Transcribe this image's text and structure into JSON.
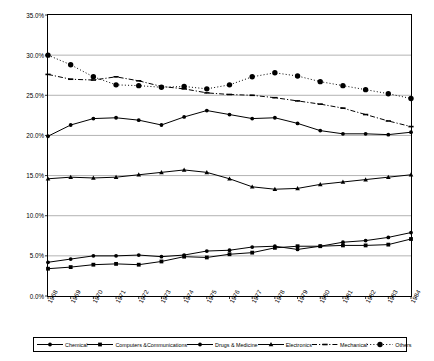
{
  "chart_data": {
    "type": "line",
    "title": "",
    "xlabel": "",
    "ylabel": "",
    "ylim": [
      0,
      35
    ],
    "ytick_format": "percent",
    "grid": true,
    "legend_position": "bottom",
    "categories": [
      "1968",
      "1969",
      "1970",
      "1971",
      "1972",
      "1973",
      "1974",
      "1975",
      "1976",
      "1977",
      "1978",
      "1979",
      "1980",
      "1981",
      "1982",
      "1983",
      "1984"
    ],
    "yticks": [
      "0.0%",
      "5.0%",
      "10.0%",
      "15.0%",
      "20.0%",
      "25.0%",
      "30.0%",
      "35.0%"
    ],
    "ytick_values": [
      0,
      5,
      10,
      15,
      20,
      25,
      30,
      35
    ],
    "series": [
      {
        "name": "Chemical",
        "marker": "circle",
        "line": "solid",
        "values": [
          19.9,
          21.3,
          22.1,
          22.2,
          22.0,
          21.6,
          22.4,
          23.1,
          22.3,
          21.6,
          21.8,
          22.3,
          23.1,
          22.5,
          22.6,
          21.5,
          20.4
        ]
      },
      {
        "name": "Computers &Communications",
        "marker": "square",
        "line": "solid",
        "values": [
          3.4,
          3.7,
          3.9,
          4.0,
          3.9,
          4.3,
          4.8,
          4.8,
          5.3,
          5.6,
          6.1,
          6.1,
          6.2,
          6.3,
          6.3,
          6.4,
          7.0
        ]
      },
      {
        "name": "Drugs & Medicine",
        "marker": "circle",
        "line": "solid",
        "values": [
          4.2,
          4.5,
          5.0,
          5.0,
          5.1,
          4.9,
          5.0,
          5.6,
          5.7,
          6.1,
          6.2,
          5.8,
          6.2,
          6.6,
          6.9,
          7.3,
          7.9
        ]
      },
      {
        "name": "Electronics",
        "marker": "triangle",
        "line": "solid",
        "values": [
          14.6,
          14.8,
          14.7,
          14.8,
          15.1,
          15.4,
          15.7,
          15.4,
          14.6,
          13.6,
          13.3,
          13.4,
          13.9,
          14.2,
          14.5,
          14.8,
          15.1
        ]
      },
      {
        "name": "Mechanical",
        "marker": "dash",
        "line": "dashdot",
        "values": [
          27.6,
          27.0,
          26.9,
          27.3,
          26.8,
          26.1,
          25.8,
          25.3,
          25.1,
          25.0,
          24.7,
          24.3,
          23.9,
          23.4,
          22.6,
          21.8,
          21.1
        ]
      },
      {
        "name": "Others",
        "marker": "bigdot",
        "line": "dotted",
        "values": [
          30.0,
          28.8,
          27.3,
          26.3,
          26.2,
          26.0,
          26.1,
          25.8,
          26.3,
          27.3,
          27.8,
          27.4,
          26.7,
          26.2,
          25.7,
          25.2,
          24.6
        ]
      }
    ],
    "series_plotted": [
      {
        "name": "Chemical",
        "values": [
          19.9,
          21.3,
          22.1,
          22.2,
          21.9,
          21.3,
          22.3,
          23.1,
          22.6,
          22.1,
          22.2,
          21.5,
          20.6,
          20.2,
          20.2,
          20.1,
          20.4
        ]
      },
      {
        "name": "Computers &Communications",
        "values": [
          3.4,
          3.6,
          3.9,
          4.0,
          3.9,
          4.3,
          4.9,
          4.8,
          5.2,
          5.4,
          6.0,
          6.2,
          6.2,
          6.3,
          6.3,
          6.4,
          7.1
        ]
      },
      {
        "name": "Drugs & Medicine",
        "values": [
          4.2,
          4.6,
          5.0,
          5.0,
          5.1,
          4.9,
          5.1,
          5.6,
          5.7,
          6.1,
          6.2,
          5.8,
          6.2,
          6.7,
          6.9,
          7.3,
          7.9
        ]
      },
      {
        "name": "Electronics",
        "values": [
          14.6,
          14.8,
          14.7,
          14.8,
          15.1,
          15.4,
          15.7,
          15.4,
          14.6,
          13.6,
          13.3,
          13.4,
          13.9,
          14.2,
          14.5,
          14.8,
          15.1
        ]
      }
    ]
  },
  "legend": {
    "items": [
      {
        "label": "Chemical",
        "marker": "circle",
        "line": "solid"
      },
      {
        "label": "Computers &Communications",
        "marker": "square",
        "line": "solid"
      },
      {
        "label": "Drugs & Medicine",
        "marker": "circle",
        "line": "solid"
      },
      {
        "label": "Electronics",
        "marker": "triangle",
        "line": "solid"
      },
      {
        "label": "Mechanical",
        "marker": "dash",
        "line": "dashdot"
      },
      {
        "label": "Others",
        "marker": "bigdot",
        "line": "dotted"
      }
    ]
  },
  "colors": {
    "axis": "#000000",
    "grid": "#808080",
    "series": "#000000",
    "background": "#ffffff"
  }
}
